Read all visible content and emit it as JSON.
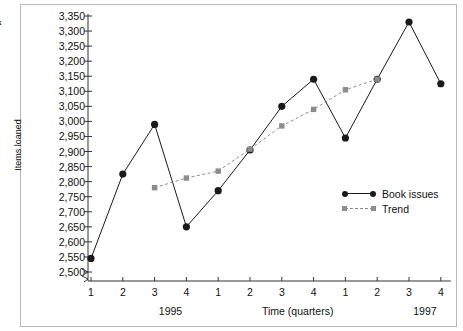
{
  "margin_notes": [
    "k",
    "|"
  ],
  "chart_data": {
    "type": "line",
    "title": "",
    "xlabel": "Time (quarters)",
    "ylabel": "Items loaned",
    "ylim": [
      2500,
      3350
    ],
    "ytick_step": 50,
    "y_axis_break": true,
    "grid": false,
    "legend_position": "inside-right",
    "x": [
      1,
      2,
      3,
      4,
      1,
      2,
      3,
      4,
      1,
      2,
      3,
      4
    ],
    "categories": [
      "1",
      "2",
      "3",
      "4",
      "1",
      "2",
      "3",
      "4",
      "1",
      "2",
      "3",
      "4"
    ],
    "ytick_labels": [
      "3,350",
      "3,300",
      "3,250",
      "3,200",
      "3,150",
      "3,100",
      "3,050",
      "3,000",
      "2,950",
      "2,900",
      "2,850",
      "2,800",
      "2,750",
      "2,700",
      "2,650",
      "2,600",
      "2,550",
      "2,500"
    ],
    "ytick_values": [
      3350,
      3300,
      3250,
      3200,
      3150,
      3100,
      3050,
      3000,
      2950,
      2900,
      2850,
      2800,
      2750,
      2700,
      2650,
      2600,
      2550,
      2500
    ],
    "group_labels": [
      {
        "text": "1995",
        "at_index": 2
      },
      {
        "text": "Time (quarters)",
        "at_index": 6
      },
      {
        "text": "1997",
        "at_index": 10
      }
    ],
    "series": [
      {
        "name": "Book issues",
        "marker": "circle",
        "line": "solid",
        "color": "#1a1a1a",
        "values": [
          2545,
          2825,
          2990,
          2650,
          2770,
          2905,
          3050,
          3140,
          2945,
          3140,
          3330,
          3125
        ]
      },
      {
        "name": "Trend",
        "marker": "square",
        "line": "dashed",
        "color": "#8c8c8c",
        "start_index": 2,
        "values": [
          null,
          null,
          2780,
          2812,
          2835,
          2908,
          2985,
          3040,
          3105,
          3140,
          null,
          null
        ]
      }
    ]
  },
  "legend": {
    "items": [
      {
        "label": "Book issues",
        "marker": "circle",
        "line": "solid"
      },
      {
        "label": "Trend",
        "marker": "square",
        "line": "dashed"
      }
    ]
  }
}
